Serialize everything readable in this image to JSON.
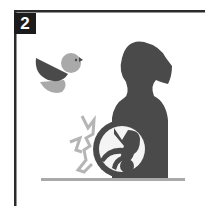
{
  "panel": {
    "step_number": "2",
    "description": "Pictogram: seated figure with a bird flying nearby and a pain/impact burst near the lower abdomen"
  },
  "colors": {
    "frame": "#2b2b2b",
    "badge_bg": "#1c1c1c",
    "badge_text": "#ffffff",
    "figure": "#4a4a4a",
    "bird_body": "#a9a9a9",
    "bird_wing": "#4a4a4a",
    "burst": "#b5b5b5",
    "ground": "#a9a9a9",
    "circle_fill": "#f4f4f4"
  },
  "icons": [
    "bird-icon",
    "person-silhouette-icon",
    "impact-burst-icon",
    "baby-in-circle-icon",
    "ground-line"
  ]
}
